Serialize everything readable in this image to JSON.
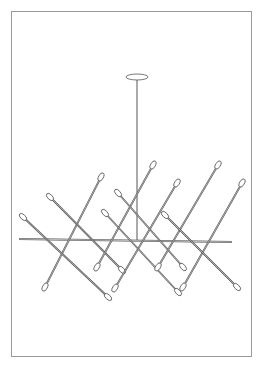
{
  "illustration": {
    "subject": "chandelier line drawing",
    "stroke_color": "#555555",
    "frame_color": "#9a9a9a",
    "canopy": {
      "cx": 137,
      "cy": 77,
      "rx": 11,
      "ry": 3
    },
    "stem": {
      "x": 137,
      "y1": 80,
      "y2": 240
    },
    "crossbar": {
      "x1": 19,
      "y1": 239,
      "x2": 232,
      "y2": 242
    },
    "rods": [
      {
        "x1": 101,
        "y1": 177,
        "x2": 45,
        "y2": 287
      },
      {
        "x1": 50,
        "y1": 197,
        "x2": 122,
        "y2": 270
      },
      {
        "x1": 23,
        "y1": 217,
        "x2": 108,
        "y2": 297
      },
      {
        "x1": 153,
        "y1": 165,
        "x2": 97,
        "y2": 267
      },
      {
        "x1": 118,
        "y1": 193,
        "x2": 183,
        "y2": 267
      },
      {
        "x1": 177,
        "y1": 183,
        "x2": 115,
        "y2": 288
      },
      {
        "x1": 105,
        "y1": 213,
        "x2": 178,
        "y2": 292
      },
      {
        "x1": 218,
        "y1": 165,
        "x2": 158,
        "y2": 267
      },
      {
        "x1": 242,
        "y1": 183,
        "x2": 183,
        "y2": 287
      },
      {
        "x1": 165,
        "y1": 215,
        "x2": 237,
        "y2": 287
      }
    ]
  }
}
